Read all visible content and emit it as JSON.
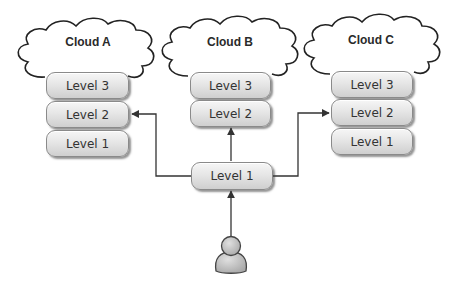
{
  "diagram": {
    "clouds": [
      {
        "label": "Cloud A",
        "levels": [
          "Level 3",
          "Level 2",
          "Level 1"
        ]
      },
      {
        "label": "Cloud B",
        "levels": [
          "Level 3",
          "Level 2"
        ]
      },
      {
        "label": "Cloud C",
        "levels": [
          "Level 3",
          "Level 2",
          "Level 1"
        ]
      }
    ],
    "entry_node": {
      "label": "Level 1"
    },
    "user": {
      "icon": "person-icon"
    },
    "colors": {
      "line": "#333333",
      "box_fill_top": "#f6f6f6",
      "box_fill_bottom": "#cfcfcf",
      "person_fill": "#c8c8c8"
    }
  }
}
